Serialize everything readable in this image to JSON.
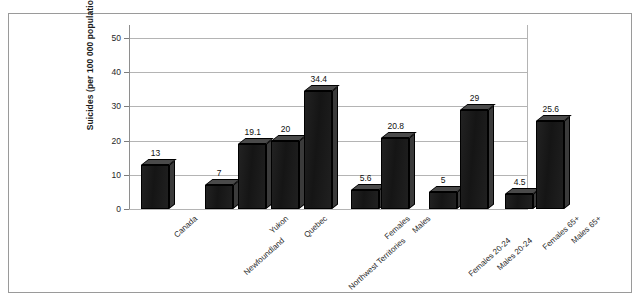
{
  "chart_data": {
    "type": "bar",
    "title": "",
    "subtitle": "",
    "xlabel": "",
    "ylabel": "Suicides (per 100 000 population)",
    "ylim": [
      0,
      50
    ],
    "yticks": [
      0,
      10,
      20,
      30,
      40,
      50
    ],
    "ytick_labels": [
      "0",
      "10",
      "20",
      "30",
      "40",
      "50"
    ],
    "grid": true,
    "legend": "none",
    "style": "3d-bar",
    "bar_color": "#1c1c1c",
    "categories": [
      "Canada",
      "Newfoundland",
      "Yukon",
      "Quebec",
      "Northwest Territories",
      "Females",
      "Males",
      "Females 20-24",
      "Males 20-24",
      "Females 65+",
      "Males 65+"
    ],
    "values": [
      13,
      7,
      19.1,
      20,
      34.4,
      5.6,
      20.8,
      5,
      29,
      4.5,
      25.6
    ],
    "data_labels": [
      "13",
      "7",
      "19.1",
      "20",
      "34.4",
      "5.6",
      "20.8",
      "5",
      "29",
      "4.5",
      "25.6"
    ],
    "groups": [
      {
        "name": "national",
        "categories": [
          "Canada"
        ]
      },
      {
        "name": "regions",
        "categories": [
          "Newfoundland",
          "Yukon",
          "Quebec",
          "Northwest Territories"
        ]
      },
      {
        "name": "sex-all-ages",
        "categories": [
          "Females",
          "Males"
        ]
      },
      {
        "name": "sex-age-20-24",
        "categories": [
          "Females 20-24",
          "Males 20-24"
        ]
      },
      {
        "name": "sex-age-65-plus",
        "categories": [
          "Females 65+",
          "Males 65+"
        ]
      }
    ]
  },
  "bars": [
    {
      "label": "Canada",
      "value": 13,
      "data_label": "13",
      "x": 12,
      "width": 28,
      "label_row": 0
    },
    {
      "label": "Newfoundland",
      "value": 7,
      "data_label": "7",
      "x": 76,
      "width": 28,
      "label_row": 1
    },
    {
      "label": "Yukon",
      "value": 19.1,
      "data_label": "19.1",
      "x": 109,
      "width": 28,
      "label_row": 0
    },
    {
      "label": "Quebec",
      "value": 20,
      "data_label": "20",
      "x": 142,
      "width": 28,
      "label_row": 0
    },
    {
      "label": "Northwest Territories",
      "value": 34.4,
      "data_label": "34.4",
      "x": 175,
      "width": 28,
      "label_row": 1
    },
    {
      "label": "Females",
      "value": 5.6,
      "data_label": "5.6",
      "x": 222,
      "width": 28,
      "label_row": 0
    },
    {
      "label": "Males",
      "value": 20.8,
      "data_label": "20.8",
      "x": 252,
      "width": 28,
      "label_row": 0
    },
    {
      "label": "Females 20-24",
      "value": 5,
      "data_label": "5",
      "x": 300,
      "width": 28,
      "label_row": 1
    },
    {
      "label": "Males 20-24",
      "value": 29,
      "data_label": "29",
      "x": 331,
      "width": 28,
      "label_row": 1
    },
    {
      "label": "Females 65+",
      "value": 4.5,
      "data_label": "4.5",
      "x": 376,
      "width": 28,
      "label_row": 0
    },
    {
      "label": "Males 65+",
      "value": 25.6,
      "data_label": "25.6",
      "x": 407,
      "width": 28,
      "label_row": 0
    }
  ]
}
